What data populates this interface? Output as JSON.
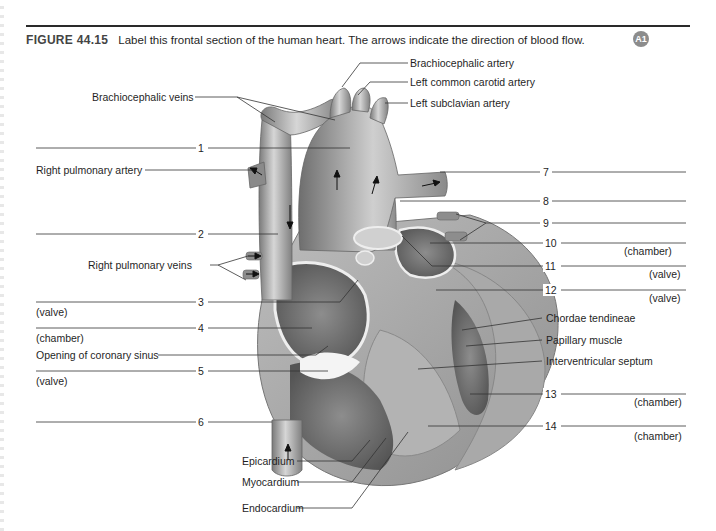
{
  "figure": {
    "number": "FIGURE 44.15",
    "caption": "Label this frontal section of the human heart. The arrows indicate the direction of blood flow.",
    "badge": "A1",
    "accent_color": "#8c8c8c"
  },
  "given_labels": {
    "brachiocephalic_artery": "Brachiocephalic artery",
    "left_common_carotid_artery": "Left common carotid artery",
    "left_subclavian_artery": "Left subclavian artery",
    "brachiocephalic_veins": "Brachiocephalic veins",
    "right_pulmonary_artery": "Right pulmonary artery",
    "right_pulmonary_veins": "Right pulmonary veins",
    "opening_of_coronary_sinus": "Opening of coronary sinus",
    "chordae_tendineae": "Chordae tendineae",
    "papillary_muscle": "Papillary muscle",
    "interventricular_septum": "Interventricular septum",
    "epicardium": "Epicardium",
    "myocardium": "Myocardium",
    "endocardium": "Endocardium"
  },
  "blanks": [
    {
      "number": "1",
      "hint": ""
    },
    {
      "number": "2",
      "hint": ""
    },
    {
      "number": "3",
      "hint": "(valve)"
    },
    {
      "number": "4",
      "hint": "(chamber)"
    },
    {
      "number": "5",
      "hint": "(valve)"
    },
    {
      "number": "6",
      "hint": ""
    },
    {
      "number": "7",
      "hint": ""
    },
    {
      "number": "8",
      "hint": ""
    },
    {
      "number": "9",
      "hint": ""
    },
    {
      "number": "10",
      "hint": "(chamber)"
    },
    {
      "number": "11",
      "hint": "(valve)"
    },
    {
      "number": "12",
      "hint": "(valve)"
    },
    {
      "number": "13",
      "hint": "(chamber)"
    },
    {
      "number": "14",
      "hint": "(chamber)"
    }
  ]
}
